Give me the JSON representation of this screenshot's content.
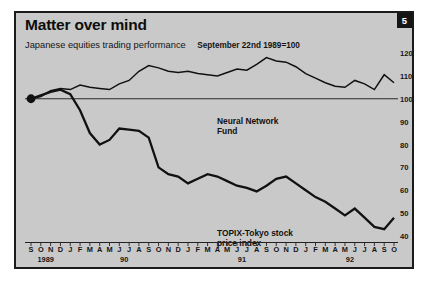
{
  "card": {
    "title": "Matter over mind",
    "subtitle": "Japanese equities trading performance",
    "basis": "September 22nd 1989=100",
    "issue_badge": "5",
    "sources": "Sources: Datastream; Fujitsu",
    "bg_color": "#c9c9c9",
    "border_color": "#1a1a1a",
    "line_color": "#111111"
  },
  "chart_data": {
    "type": "line",
    "title": "Matter over mind",
    "subtitle": "Japanese equities trading performance",
    "annotation": "September 22nd 1989=100",
    "xlabel": "",
    "ylabel": "",
    "ylim": [
      40,
      120
    ],
    "yticks": [
      120,
      110,
      100,
      90,
      80,
      70,
      60,
      50,
      40
    ],
    "grid": false,
    "legend_position": "inline-annotations",
    "panel_divider_value": 100,
    "start_marker": {
      "x": "1989-09",
      "y": 100,
      "shape": "filled-circle"
    },
    "years": [
      {
        "label": "1989",
        "months": [
          "S",
          "O",
          "N",
          "D"
        ]
      },
      {
        "label": "90",
        "months": [
          "J",
          "F",
          "M",
          "A",
          "M",
          "J",
          "J",
          "A",
          "S",
          "O",
          "N",
          "D"
        ]
      },
      {
        "label": "91",
        "months": [
          "J",
          "F",
          "M",
          "A",
          "M",
          "J",
          "J",
          "A",
          "S",
          "O",
          "N",
          "D"
        ]
      },
      {
        "label": "92",
        "months": [
          "J",
          "F",
          "M",
          "A",
          "M",
          "J",
          "J",
          "A",
          "S",
          "O"
        ]
      }
    ],
    "x": [
      "1989-09",
      "1989-10",
      "1989-11",
      "1989-12",
      "1990-01",
      "1990-02",
      "1990-03",
      "1990-04",
      "1990-05",
      "1990-06",
      "1990-07",
      "1990-08",
      "1990-09",
      "1990-10",
      "1990-11",
      "1990-12",
      "1991-01",
      "1991-02",
      "1991-03",
      "1991-04",
      "1991-05",
      "1991-06",
      "1991-07",
      "1991-08",
      "1991-09",
      "1991-10",
      "1991-11",
      "1991-12",
      "1992-01",
      "1992-02",
      "1992-03",
      "1992-04",
      "1992-05",
      "1992-06",
      "1992-07",
      "1992-08",
      "1992-09",
      "1992-10"
    ],
    "series": [
      {
        "name": "Neural Network Fund",
        "label_lines": [
          "Neural Network",
          "Fund"
        ],
        "values": [
          100,
          101,
          103.5,
          104.5,
          104,
          106,
          105,
          104.5,
          104,
          106.5,
          108,
          112,
          114.5,
          113.5,
          112,
          111.5,
          112,
          111,
          110.5,
          110,
          111.5,
          113,
          112.5,
          115,
          118,
          116.5,
          116,
          114,
          111,
          109,
          107,
          105.5,
          105,
          108,
          106.5,
          104,
          110.5,
          107
        ]
      },
      {
        "name": "TOPIX-Tokyo stock price index",
        "label_lines": [
          "TOPIX-Tokyo stock",
          "price index"
        ],
        "values": [
          100,
          101.5,
          103,
          104,
          102,
          95,
          85,
          80,
          82,
          87,
          86.5,
          86,
          83,
          70,
          67,
          66,
          63,
          65,
          67,
          66,
          64,
          62,
          61,
          59.5,
          62,
          65,
          66,
          63,
          60,
          57,
          55,
          52,
          49,
          52,
          48,
          44,
          43,
          48
        ]
      }
    ]
  }
}
